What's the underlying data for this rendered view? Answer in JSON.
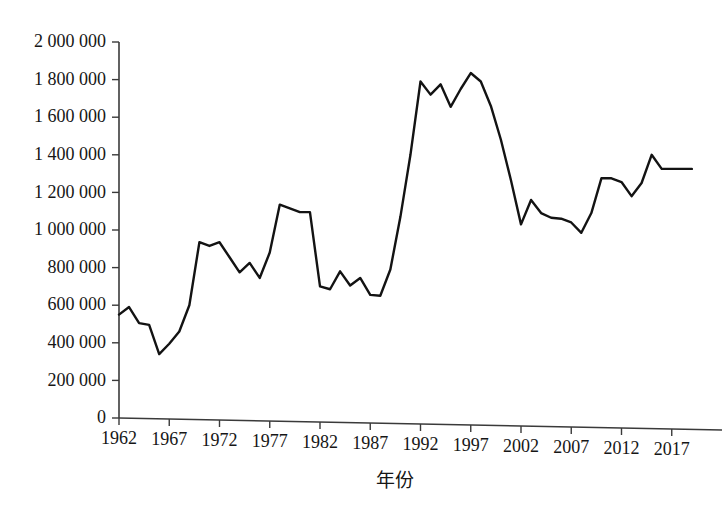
{
  "chart_data": {
    "type": "line",
    "title": "",
    "subtitle": "",
    "xlabel": "年份",
    "ylabel": "",
    "xlim": [
      1962,
      2019
    ],
    "ylim": [
      0,
      2000000
    ],
    "grid": false,
    "legend": null,
    "x_tick_labels": [
      "1962",
      "1967",
      "1972",
      "1977",
      "1982",
      "1987",
      "1992",
      "1997",
      "2002",
      "2007",
      "2012",
      "2017"
    ],
    "x_tick_values": [
      1962,
      1967,
      1972,
      1977,
      1982,
      1987,
      1992,
      1997,
      2002,
      2007,
      2012,
      2017
    ],
    "y_tick_labels": [
      "0",
      "200 000",
      "400 000",
      "600 000",
      "800 000",
      "1 000 000",
      "1 200 000",
      "1 400 000",
      "1 600 000",
      "1 800 000",
      "2 000 000"
    ],
    "y_tick_values": [
      0,
      200000,
      400000,
      600000,
      800000,
      1000000,
      1200000,
      1400000,
      1600000,
      1800000,
      2000000
    ],
    "x": [
      1962,
      1963,
      1964,
      1965,
      1966,
      1967,
      1968,
      1969,
      1970,
      1971,
      1972,
      1973,
      1974,
      1975,
      1976,
      1977,
      1978,
      1979,
      1980,
      1981,
      1982,
      1983,
      1984,
      1985,
      1986,
      1987,
      1988,
      1989,
      1990,
      1991,
      1992,
      1993,
      1994,
      1995,
      1996,
      1997,
      1998,
      1999,
      2000,
      2001,
      2002,
      2003,
      2004,
      2005,
      2006,
      2007,
      2008,
      2009,
      2010,
      2011,
      2012,
      2013,
      2014,
      2015,
      2016,
      2017,
      2018,
      2019
    ],
    "values": [
      550000,
      590000,
      505000,
      495000,
      340000,
      395000,
      460000,
      600000,
      935000,
      915000,
      935000,
      855000,
      775000,
      825000,
      745000,
      880000,
      1135000,
      1115000,
      1095000,
      1095000,
      700000,
      685000,
      780000,
      705000,
      745000,
      655000,
      650000,
      790000,
      1070000,
      1400000,
      1790000,
      1720000,
      1775000,
      1655000,
      1750000,
      1835000,
      1790000,
      1660000,
      1480000,
      1265000,
      1030000,
      1160000,
      1090000,
      1065000,
      1060000,
      1040000,
      985000,
      1090000,
      1275000,
      1275000,
      1255000,
      1180000,
      1250000,
      1400000,
      1325000,
      1325000,
      1325000,
      1325000
    ],
    "line_color": "#131313",
    "axis_color": "#3a3a3a",
    "background": "#ffffff",
    "series_name": ""
  },
  "figure": {
    "x_axis_label": "年份"
  }
}
